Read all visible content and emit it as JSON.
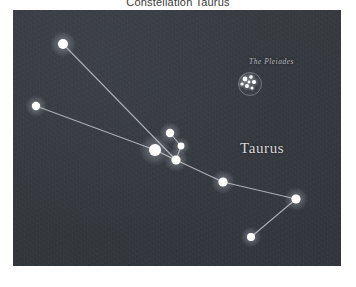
{
  "page": {
    "title": "Constellation Taurus",
    "background_color": "#ffffff"
  },
  "sky": {
    "panel_color": "#35383d",
    "star_color": "#ffffff",
    "line_color": "#c9cbd0",
    "bounds": {
      "x": 13,
      "y": 10,
      "width": 328,
      "height": 256
    }
  },
  "labels": {
    "constellation": "Taurus",
    "cluster": "The Pleiades"
  },
  "chart_data": {
    "type": "scatter",
    "title": "Constellation Taurus",
    "xlabel": "",
    "ylabel": "",
    "xlim": [
      0,
      328
    ],
    "ylim": [
      0,
      256
    ],
    "grid": false,
    "legend": "none",
    "annotations": [
      {
        "text": "Taurus",
        "x": 227,
        "y": 130
      },
      {
        "text": "The Pleiades",
        "x": 236,
        "y": 47
      }
    ],
    "stars": [
      {
        "name": "elnath",
        "x": 50,
        "y": 34,
        "r": 5.0
      },
      {
        "name": "zeta-tauri",
        "x": 23,
        "y": 96,
        "r": 4.2
      },
      {
        "name": "aldebaran",
        "x": 142,
        "y": 140,
        "r": 6.0
      },
      {
        "name": "epsilon-tauri",
        "x": 157,
        "y": 123,
        "r": 4.2
      },
      {
        "name": "delta-tauri",
        "x": 168,
        "y": 136,
        "r": 3.4
      },
      {
        "name": "gamma-tauri",
        "x": 163,
        "y": 150,
        "r": 4.6
      },
      {
        "name": "theta-tauri",
        "x": 210,
        "y": 172,
        "r": 4.6
      },
      {
        "name": "lambda-tauri",
        "x": 283,
        "y": 189,
        "r": 4.6
      },
      {
        "name": "xi-tauri",
        "x": 238,
        "y": 227,
        "r": 4.0
      }
    ],
    "links": [
      [
        "elnath",
        "gamma-tauri"
      ],
      [
        "zeta-tauri",
        "aldebaran"
      ],
      [
        "aldebaran",
        "gamma-tauri"
      ],
      [
        "epsilon-tauri",
        "delta-tauri"
      ],
      [
        "delta-tauri",
        "gamma-tauri"
      ],
      [
        "gamma-tauri",
        "theta-tauri"
      ],
      [
        "theta-tauri",
        "lambda-tauri"
      ],
      [
        "lambda-tauri",
        "xi-tauri"
      ]
    ],
    "cluster": {
      "name": "pleiades",
      "cx": 236,
      "cy": 73,
      "r": 11,
      "members": [
        {
          "x": 232,
          "y": 69,
          "r": 2.4
        },
        {
          "x": 238,
          "y": 67,
          "r": 1.8
        },
        {
          "x": 241,
          "y": 72,
          "r": 2.1
        },
        {
          "x": 234,
          "y": 76,
          "r": 2.0
        },
        {
          "x": 229,
          "y": 74,
          "r": 1.6
        },
        {
          "x": 239,
          "y": 78,
          "r": 1.5
        },
        {
          "x": 236,
          "y": 72,
          "r": 1.4
        }
      ]
    }
  }
}
